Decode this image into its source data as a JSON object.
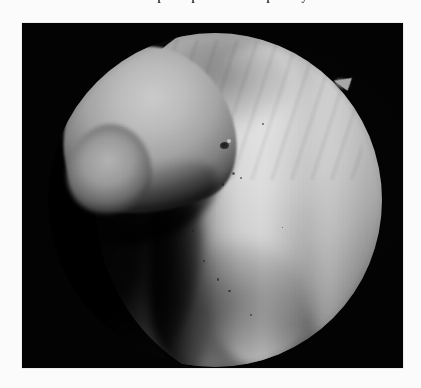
{
  "page": {
    "background_color": "#fbfbfb",
    "width": 421,
    "height": 388,
    "clipped_top_text": "ment occurs at this step the operation is temporarily"
  },
  "figure": {
    "name": "endoscopic-photograph",
    "modality": "endoscopy",
    "color_mode": "grayscale",
    "plate": {
      "x": 22,
      "y": 23,
      "width": 381,
      "height": 345,
      "background_color": "#030303"
    },
    "field_of_view": {
      "shape": "circle",
      "center_x": 215,
      "center_y": 200,
      "radius": 167
    },
    "tones": {
      "surround_black": "#030303",
      "brightest_tissue": "#cfcfcf",
      "midtone_tissue": "#a9a9a9",
      "shadow_tissue": "#5c5c5c",
      "deep_shadow": "#0a0a0a"
    },
    "features": [
      {
        "name": "hook-structure",
        "label": "Hook-shaped bright structure, upper left",
        "position": "upper-left"
      },
      {
        "name": "tissue-mass",
        "label": "Large illuminated tissue mass",
        "position": "right"
      },
      {
        "name": "shadow-groove",
        "label": "Deep vertical shadow groove left of centre",
        "position": "centre-left"
      },
      {
        "name": "lesion-spot",
        "label": "Small dark focal spot",
        "position": "centre-upper"
      },
      {
        "name": "rim-spike",
        "label": "Triangular instrument tip at upper-right rim",
        "position": "upper-right-rim"
      }
    ],
    "speckles": [
      {
        "x": 55.0,
        "y": 41.5,
        "size": 3.0
      },
      {
        "x": 52.0,
        "y": 45.0,
        "size": 2.4
      },
      {
        "x": 57.5,
        "y": 43.0,
        "size": 2.0
      },
      {
        "x": 50.5,
        "y": 73.5,
        "size": 2.6
      },
      {
        "x": 54.0,
        "y": 77.0,
        "size": 2.2
      },
      {
        "x": 46.5,
        "y": 68.0,
        "size": 2.0
      },
      {
        "x": 60.5,
        "y": 84.0,
        "size": 2.3
      },
      {
        "x": 43.0,
        "y": 59.0,
        "size": 1.9
      },
      {
        "x": 64.0,
        "y": 27.0,
        "size": 1.8
      },
      {
        "x": 70.0,
        "y": 58.0,
        "size": 1.7
      }
    ]
  }
}
